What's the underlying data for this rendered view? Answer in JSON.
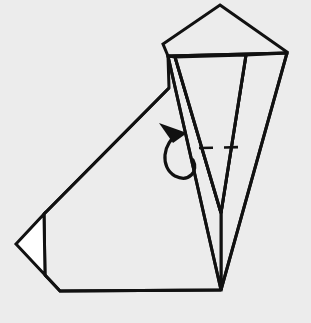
{
  "figure": {
    "title": "Origami fold diagram step",
    "background_color": "#ececec",
    "ink_color": "#111111",
    "paper_front_color": "#ececec",
    "paper_back_color": "#ffffff",
    "width": 311,
    "height": 323
  },
  "geometry": {
    "body_outline": "169,88 44,214 16,244 45,275 60,291 221,290",
    "body_polygon_points": "169,88 44,214 45,275 60,291 221,290 221,290",
    "head_pentagon_points": "220,5 287,52 287,53 168,56 163,44",
    "left_flap_points": "168,56 221,290 221,213 175,57",
    "right_flap_points": "287,53 221,290 221,213 246,55",
    "inner_v_points": "175,57 246,55 221,213",
    "white_triangle_points": "16,244 44,214 45,275",
    "long_diagonal": "169,88 44,214",
    "body_bottom_edge": "60,291 221,290",
    "head_bottom_edge": "168,56 287,53",
    "v_apex": "221,213",
    "body_right_corner": "221,290"
  },
  "annotations": {
    "dashed_crease": {
      "name": "valley-fold-crease",
      "from_x": 199,
      "from_y": 148,
      "to_x": 246,
      "to_y": 147,
      "style": "dashed"
    },
    "fold_arrow": {
      "name": "fold-arrow",
      "description": "curved tuck arrow pointing left",
      "loop_path": "M 178,133 C 163,141 161,166 175,174 C 188,181 198,170 193,160",
      "head_points": "160,124 186,134 172,142",
      "direction": "left"
    }
  },
  "labels": {
    "step_number": "",
    "caption": ""
  }
}
